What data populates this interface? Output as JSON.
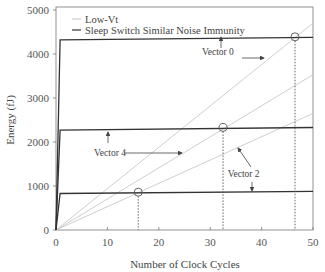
{
  "chart_data": {
    "type": "line",
    "title": "",
    "xlabel": "Number of Clock Cycles",
    "ylabel": "Energy (fJ)",
    "xlim": [
      0,
      50
    ],
    "ylim": [
      0,
      5000
    ],
    "xticks": [
      0,
      10,
      20,
      30,
      40,
      50
    ],
    "yticks": [
      0,
      1000,
      2000,
      3000,
      4000,
      5000
    ],
    "grid": false,
    "legend": {
      "position": "upper-left",
      "entries": [
        {
          "label": "Low-Vt",
          "color": "#cfcfcf"
        },
        {
          "label": "Sleep Switch Similar Noise Immunity",
          "color": "#333333"
        }
      ]
    },
    "series": [
      {
        "name": "Low-Vt (Vector 0)",
        "group": "Low-Vt",
        "color": "#cfcfcf",
        "x": [
          0,
          50
        ],
        "y": [
          0,
          4700
        ]
      },
      {
        "name": "Low-Vt (Vector 4)",
        "group": "Low-Vt",
        "color": "#cfcfcf",
        "x": [
          0,
          50
        ],
        "y": [
          0,
          3530
        ]
      },
      {
        "name": "Low-Vt (Vector 2)",
        "group": "Low-Vt",
        "color": "#cfcfcf",
        "x": [
          0,
          50
        ],
        "y": [
          0,
          2650
        ]
      },
      {
        "name": "Sleep Switch (Vector 0)",
        "group": "Sleep Switch Similar Noise Immunity",
        "color": "#333333",
        "x": [
          0,
          0.8,
          50
        ],
        "y": [
          0,
          4320,
          4380
        ]
      },
      {
        "name": "Sleep Switch (Vector 4)",
        "group": "Sleep Switch Similar Noise Immunity",
        "color": "#333333",
        "x": [
          0,
          0.8,
          50
        ],
        "y": [
          0,
          2270,
          2330
        ]
      },
      {
        "name": "Sleep Switch (Vector 2)",
        "group": "Sleep Switch Similar Noise Immunity",
        "color": "#333333",
        "x": [
          0,
          0.8,
          50
        ],
        "y": [
          0,
          830,
          880
        ]
      }
    ],
    "crossover_points": [
      {
        "x": 16,
        "y": 860
      },
      {
        "x": 32.5,
        "y": 2330
      },
      {
        "x": 46.5,
        "y": 4390
      }
    ],
    "annotations": [
      {
        "text": "Vector 0",
        "x": 31.5,
        "y": 4050
      },
      {
        "text": "Vector 4",
        "x": 10.5,
        "y": 1760
      },
      {
        "text": "Vector 2",
        "x": 36.5,
        "y": 1270
      }
    ]
  }
}
